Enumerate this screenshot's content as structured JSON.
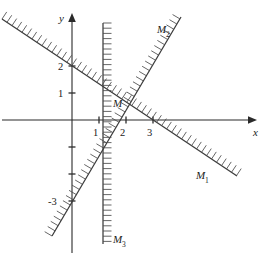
{
  "figure": {
    "background_color": "#ffffff",
    "ink_color": "#2a2a2a",
    "hatch_color": "#4a4a4a"
  },
  "axes": {
    "x_label": "x",
    "y_label": "y",
    "origin_px": {
      "x": 72,
      "y": 120
    },
    "unit_px": 27,
    "x_range": [
      -2.7,
      6.6
    ],
    "y_range": [
      -5.0,
      3.9
    ],
    "x_axis_arrow": true,
    "y_axis_arrow": true,
    "grid": false
  },
  "ticks": {
    "x": [
      {
        "value": 1,
        "label": "1"
      },
      {
        "value": 2,
        "label": "2"
      },
      {
        "value": 3,
        "label": "3"
      }
    ],
    "y": [
      {
        "value": 2,
        "label": "2"
      },
      {
        "value": 1,
        "label": "1"
      },
      {
        "value": -1,
        "label": ""
      },
      {
        "value": -2,
        "label": ""
      },
      {
        "value": -3,
        "label": "-3"
      }
    ]
  },
  "chart_data": {
    "type": "line",
    "xlabel": "x",
    "ylabel": "y",
    "xlim": [
      -2.7,
      6.6
    ],
    "ylim": [
      -5.0,
      3.9
    ],
    "grid": false,
    "legend": "inline-labels",
    "series": [
      {
        "name": "M1",
        "label": "M",
        "subscript": "1",
        "kind": "boundary-line",
        "slope": -0.67,
        "intercept": 2.0,
        "points": [
          {
            "x": -2.6,
            "y": 3.73
          },
          {
            "x": 0,
            "y": 2.0
          },
          {
            "x": 3,
            "y": 0.0
          },
          {
            "x": 6.1,
            "y": -2.07
          }
        ],
        "hatch_side": "upper-right",
        "label_position": {
          "x": 4.55,
          "y": -1.85
        }
      },
      {
        "name": "M2",
        "label": "M",
        "subscript": "2",
        "kind": "boundary-line",
        "slope": 1.7,
        "intercept": -3.0,
        "points": [
          {
            "x": -0.75,
            "y": -4.28
          },
          {
            "x": 0,
            "y": -3.0
          },
          {
            "x": 2,
            "y": 0.4
          },
          {
            "x": 4.0,
            "y": 3.8
          }
        ],
        "hatch_side": "upper-left",
        "label_position": {
          "x": 3.3,
          "y": 3.45
        }
      },
      {
        "name": "M3",
        "label": "M",
        "subscript": "3",
        "kind": "boundary-line-vertical",
        "x_value": 1.15,
        "points": [
          {
            "x": 1.15,
            "y": 3.6
          },
          {
            "x": 1.15,
            "y": -4.6
          }
        ],
        "hatch_side": "right",
        "label_position": {
          "x": 1.55,
          "y": -4.55
        }
      }
    ],
    "annotations": [
      {
        "text": "M",
        "kind": "region-label",
        "position": {
          "x": 1.52,
          "y": 0.62
        },
        "description": "feasible region label"
      }
    ]
  },
  "labels": {
    "region": "M",
    "line1": "M",
    "line1_sub": "1",
    "line2": "M",
    "line2_sub": "2",
    "line3": "M",
    "line3_sub": "3",
    "axis_x": "x",
    "axis_y": "y",
    "tick_x1": "1",
    "tick_x2": "2",
    "tick_x3": "3",
    "tick_y1": "1",
    "tick_y2": "2",
    "tick_ym3": "-3"
  }
}
